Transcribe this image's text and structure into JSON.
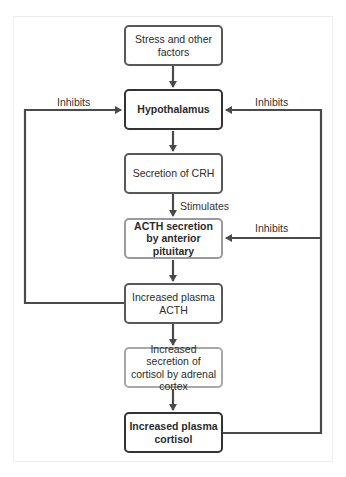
{
  "diagram": {
    "boxes": [
      {
        "id": "stress",
        "label": "Stress and other factors"
      },
      {
        "id": "hypothalamus",
        "label": "Hypothalamus"
      },
      {
        "id": "crh",
        "label": "Secretion of CRH"
      },
      {
        "id": "acth-secretion",
        "label": "ACTH secretion by anterior pituitary"
      },
      {
        "id": "plasma-acth",
        "label": "Increased plasma ACTH"
      },
      {
        "id": "cortisol-secretion",
        "label": "Increased secretion of cortisol by adrenal cortex"
      },
      {
        "id": "plasma-cortisol",
        "label": "Increased plasma cortisol"
      }
    ],
    "edge_labels": {
      "stimulates": "Stimulates",
      "inhibits_left": "Inhibits",
      "inhibits_right_top": "Inhibits",
      "inhibits_right_mid": "Inhibits"
    },
    "colors": {
      "line": "#4a4a4a",
      "border_dark": "#333333",
      "border_medium": "#585858",
      "border_light": "#a8a8a8",
      "frame": "#efefef"
    }
  }
}
